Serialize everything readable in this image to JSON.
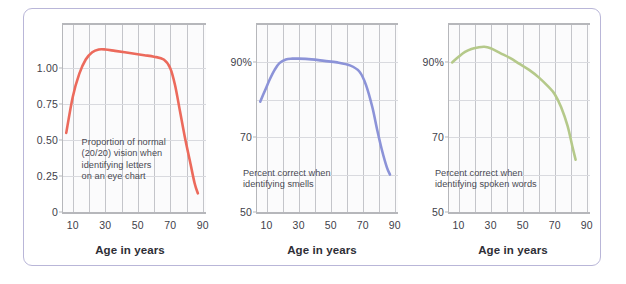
{
  "figure": {
    "border_color": "#b9b6d8",
    "background": "#ffffff"
  },
  "chart_data": [
    {
      "type": "line",
      "title": "",
      "annotation": "Proportion of normal\n(20/20) vision when\nidentifying letters\non an eye chart",
      "xlabel": "Age in years",
      "ylabel": "",
      "color": "#ec6a5c",
      "xlim": [
        4,
        92
      ],
      "ylim": [
        0,
        1.3
      ],
      "xticks": [
        10,
        30,
        50,
        70,
        90
      ],
      "xtick_labels": [
        "10",
        "30",
        "50",
        "70",
        "90"
      ],
      "yticks": [
        0,
        0.25,
        0.5,
        0.75,
        1.0
      ],
      "ytick_labels": [
        "0",
        "0.25",
        "0.50",
        "0.75",
        "1.00"
      ],
      "gridlines_v": [
        10,
        20,
        30,
        40,
        50,
        60,
        70,
        80,
        90
      ],
      "gridlines_h": [
        0.25,
        0.5,
        0.75,
        1.0
      ],
      "x": [
        6,
        10,
        14,
        18,
        22,
        26,
        30,
        36,
        42,
        48,
        54,
        60,
        66,
        70,
        73,
        76,
        79,
        82,
        85,
        87
      ],
      "y": [
        0.55,
        0.8,
        0.96,
        1.06,
        1.11,
        1.13,
        1.13,
        1.12,
        1.11,
        1.1,
        1.09,
        1.08,
        1.06,
        1.0,
        0.88,
        0.7,
        0.52,
        0.36,
        0.2,
        0.13
      ]
    },
    {
      "type": "line",
      "title": "",
      "annotation": "Percent correct when\nidentifying smells",
      "xlabel": "Age in years",
      "ylabel": "",
      "color": "#8c93d8",
      "xlim": [
        4,
        92
      ],
      "ylim": [
        50,
        100
      ],
      "xticks": [
        10,
        30,
        50,
        70,
        90
      ],
      "xtick_labels": [
        "10",
        "30",
        "50",
        "70",
        "90"
      ],
      "yticks": [
        50,
        70,
        90
      ],
      "ytick_labels": [
        "50",
        "70",
        "90%"
      ],
      "gridlines_v": [
        10,
        20,
        30,
        40,
        50,
        60,
        70,
        80,
        90
      ],
      "gridlines_h": [
        60,
        70,
        80,
        90
      ],
      "x": [
        6,
        9,
        12,
        15,
        18,
        22,
        26,
        30,
        38,
        46,
        54,
        62,
        68,
        72,
        76,
        79,
        82,
        85,
        87
      ],
      "y": [
        79.5,
        82.5,
        85.5,
        88.0,
        89.8,
        90.8,
        91.0,
        91.0,
        90.8,
        90.4,
        90.0,
        89.2,
        87.5,
        84.0,
        78.0,
        72.0,
        66.5,
        62.0,
        60.0
      ]
    },
    {
      "type": "line",
      "title": "",
      "annotation": "Percent correct when\nidentifying spoken words",
      "xlabel": "Age in years",
      "ylabel": "",
      "color": "#b5c98a",
      "xlim": [
        4,
        92
      ],
      "ylim": [
        50,
        100
      ],
      "xticks": [
        10,
        30,
        50,
        70,
        90
      ],
      "xtick_labels": [
        "10",
        "30",
        "50",
        "70",
        "90"
      ],
      "yticks": [
        50,
        70,
        90
      ],
      "ytick_labels": [
        "50",
        "70",
        "90%"
      ],
      "gridlines_v": [
        10,
        20,
        30,
        40,
        50,
        60,
        70,
        80,
        90
      ],
      "gridlines_h": [
        60,
        70,
        80,
        90
      ],
      "x": [
        6,
        10,
        14,
        18,
        22,
        26,
        30,
        36,
        42,
        48,
        54,
        60,
        66,
        70,
        74,
        78,
        81,
        83
      ],
      "y": [
        90.0,
        91.5,
        92.8,
        93.6,
        94.0,
        94.2,
        93.8,
        92.5,
        91.2,
        89.6,
        88.0,
        86.0,
        83.5,
        81.5,
        78.0,
        73.0,
        67.5,
        64.0
      ]
    }
  ]
}
